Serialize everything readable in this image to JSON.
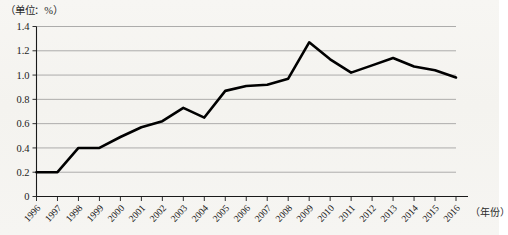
{
  "unit_label": "（单位：%）",
  "x_axis_caption": "（年份）",
  "chart_data": {
    "type": "line",
    "title": "",
    "subtitle": "",
    "xlabel": "（年份）",
    "ylabel": "（单位：%）",
    "xlim": [
      1996,
      2016
    ],
    "ylim": [
      0,
      1.4
    ],
    "grid": true,
    "legend": false,
    "legend_position": "none",
    "line_color": "#000000",
    "categories": [
      "1996",
      "1997",
      "1998",
      "1999",
      "2000",
      "2001",
      "2002",
      "2003",
      "2004",
      "2005",
      "2006",
      "2007",
      "2008",
      "2009",
      "2010",
      "2011",
      "2012",
      "2013",
      "2014",
      "2015",
      "2016"
    ],
    "values": [
      0.2,
      0.2,
      0.4,
      0.4,
      0.49,
      0.57,
      0.62,
      0.73,
      0.65,
      0.87,
      0.91,
      0.92,
      0.97,
      1.27,
      1.13,
      1.02,
      1.08,
      1.14,
      1.07,
      1.04,
      0.98
    ],
    "ytick_labels": [
      "0",
      "0.2",
      "0.4",
      "0.6",
      "0.8",
      "1.0",
      "1.2",
      "1.4"
    ],
    "ytick_values": [
      0,
      0.2,
      0.4,
      0.6,
      0.8,
      1.0,
      1.2,
      1.4
    ],
    "annotations": []
  }
}
